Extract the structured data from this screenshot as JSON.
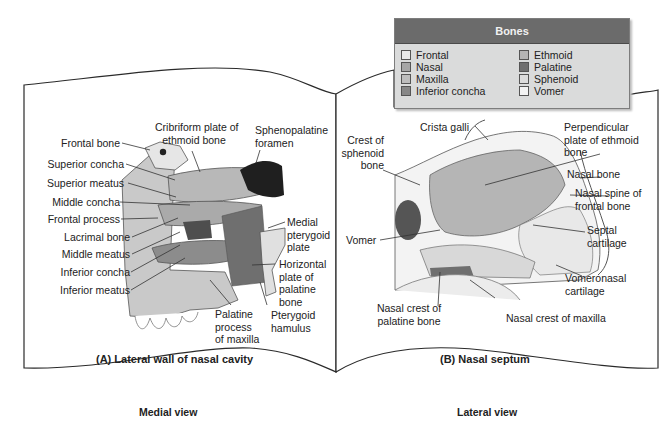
{
  "legend": {
    "title": "Bones",
    "items": [
      {
        "label": "Frontal",
        "color": "#e9e9e9"
      },
      {
        "label": "Ethmoid",
        "color": "#b5b5b5"
      },
      {
        "label": "Nasal",
        "color": "#a6a6a6"
      },
      {
        "label": "Palatine",
        "color": "#6f6f6f"
      },
      {
        "label": "Maxilla",
        "color": "#bdbdbd"
      },
      {
        "label": "Sphenoid",
        "color": "#dcdcdc"
      },
      {
        "label": "Inferior concha",
        "color": "#878787"
      },
      {
        "label": "Vomer",
        "color": "#f3f3f3"
      }
    ]
  },
  "panel_a": {
    "caption": "(A) Lateral wall of nasal cavity",
    "view": "Medial view",
    "labels": {
      "frontal_bone": "Frontal bone",
      "superior_concha": "Superior concha",
      "superior_meatus": "Superior meatus",
      "middle_concha": "Middle concha",
      "frontal_process": "Frontal process",
      "lacrimal_bone": "Lacrimal bone",
      "middle_meatus": "Middle meatus",
      "inferior_concha": "Inferior concha",
      "inferior_meatus": "Inferior meatus",
      "cribriform_1": "Cribriform plate of",
      "cribriform_2": "ethmoid bone",
      "spheno_1": "Sphenopalatine",
      "spheno_2": "foramen",
      "medial_pter_1": "Medial",
      "medial_pter_2": "pterygoid",
      "medial_pter_3": "plate",
      "horiz_1": "Horizontal",
      "horiz_2": "plate of",
      "horiz_3": "palatine",
      "horiz_4": "bone",
      "palatine_proc_1": "Palatine",
      "palatine_proc_2": "process",
      "palatine_proc_3": "of maxilla",
      "hamulus_1": "Pterygoid",
      "hamulus_2": "hamulus"
    }
  },
  "panel_b": {
    "caption": "(B) Nasal septum",
    "view": "Lateral view",
    "labels": {
      "crista_galli": "Crista galli",
      "crest_sph_1": "Crest of",
      "crest_sph_2": "sphenoid",
      "crest_sph_3": "bone",
      "perp_1": "Perpendicular",
      "perp_2": "plate of ethmoid",
      "perp_3": "bone",
      "nasal_bone": "Nasal bone",
      "nasal_spine_1": "Nasal spine of",
      "nasal_spine_2": "frontal bone",
      "septal_1": "Septal",
      "septal_2": "cartilage",
      "vomer": "Vomer",
      "vomeronasal_1": "Vomeronasal",
      "vomeronasal_2": "cartilage",
      "nasal_crest_pal_1": "Nasal crest of",
      "nasal_crest_pal_2": "palatine bone",
      "nasal_crest_max": "Nasal crest of maxilla"
    }
  }
}
